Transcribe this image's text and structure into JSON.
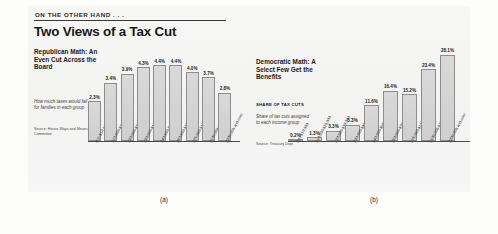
{
  "kicker": "ON THE OTHER HAND . . .",
  "headline": "Two Views of a Tax Cut",
  "figure_labels": {
    "left": "(a)",
    "right": "(b)"
  },
  "panel_left": {
    "title": "Republican Math: An Even Cut Across the Board",
    "caption": "How much taxes would fall for families in each group",
    "source": "Source: House Ways and Means Committee"
  },
  "panel_right": {
    "title": "Democratic Math: A Select Few Get the Benefits",
    "series_head": "SHARE OF TAX CUTS",
    "caption": "Share of tax cuts assigned to each income group",
    "source": "Source: Treasury Dept."
  },
  "chart_data": [
    {
      "type": "bar",
      "title": "Republican Math: An Even Cut Across the Board",
      "subtitle": "How much taxes would fall for families in each group",
      "xlabel": "",
      "ylabel": "Percent tax cut",
      "ylim": [
        0,
        5
      ],
      "grid": false,
      "legend": "none",
      "source": "Source: House Ways and Means Committee",
      "categories": [
        "0 to $10,000",
        "$10,000-$20,000",
        "$20,000-$30,000",
        "$30,000-$40,000",
        "$40,000-$50,000",
        "$50,000-$75,000",
        "$75,000-$100,000",
        "$100,000-$200,000",
        "$200,000 and over"
      ],
      "values": [
        2.3,
        3.4,
        3.9,
        4.3,
        4.4,
        4.4,
        4.0,
        3.7,
        2.8
      ],
      "value_labels": [
        "2.3%",
        "3.4%",
        "3.9%",
        "4.3%",
        "4.4%",
        "4.4%",
        "4.0%",
        "3.7%",
        "2.8%"
      ]
    },
    {
      "type": "bar",
      "title": "Democratic Math: A Select Few Get the Benefits",
      "subtitle": "Share of tax cuts assigned to each income group",
      "xlabel": "",
      "ylabel": "Share of tax cuts",
      "ylim": [
        0,
        30
      ],
      "grid": false,
      "legend": "none",
      "source": "Source: Treasury Dept.",
      "categories": [
        "0 to $10,000",
        "$10,000-$20,000",
        "$20,000-$30,000",
        "$30,000-$40,000",
        "$40,000-$50,000",
        "$50,000-$75,000",
        "$75,000-$100,000",
        "$100,000-$200,000",
        "$200,000 and over"
      ],
      "values": [
        0.2,
        1.3,
        3.3,
        5.3,
        11.6,
        16.4,
        15.2,
        23.4,
        28.1
      ],
      "value_labels": [
        "0.2%",
        "1.3%",
        "3.3%",
        "5.3%",
        "11.6%",
        "16.4%",
        "15.2%",
        "23.4%",
        "28.1%"
      ]
    }
  ]
}
